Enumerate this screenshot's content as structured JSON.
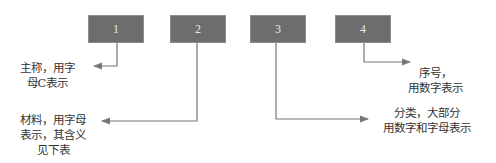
{
  "boxes": [
    {
      "label": "1"
    },
    {
      "label": "2"
    },
    {
      "label": "3"
    },
    {
      "label": "4"
    }
  ],
  "annotations": [
    {
      "target": "1",
      "text": "主称，用字\n母C表示"
    },
    {
      "target": "2",
      "text": "材料，用字母\n表示，其含义\n见下表"
    },
    {
      "target": "3",
      "text": "分类，大部分\n用数字和字母表示"
    },
    {
      "target": "4",
      "text": "序号，\n用数字表示"
    }
  ],
  "colors": {
    "box_fill": "#6d6d6d",
    "line": "#777777",
    "text": "#333333"
  }
}
